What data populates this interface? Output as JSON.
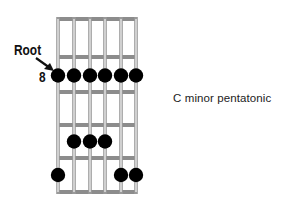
{
  "diagram": {
    "title": "C minor pentatonic",
    "root_label": "Root",
    "start_fret_label": "8",
    "strings": 6,
    "frets_shown": 5,
    "colors": {
      "string": "#9a9a9a",
      "fret": "#8c8c8c",
      "dot": "#000000",
      "text": "#111111"
    },
    "geometry": {
      "string_x": [
        58,
        74,
        90,
        105,
        121,
        136
      ],
      "fret_y": [
        19,
        57,
        92,
        125,
        158,
        192
      ]
    },
    "notes": [
      {
        "string": 1,
        "fret_row": 2,
        "label": "root"
      },
      {
        "string": 2,
        "fret_row": 2
      },
      {
        "string": 3,
        "fret_row": 2
      },
      {
        "string": 4,
        "fret_row": 2
      },
      {
        "string": 5,
        "fret_row": 2
      },
      {
        "string": 6,
        "fret_row": 2
      },
      {
        "string": 2,
        "fret_row": 4
      },
      {
        "string": 3,
        "fret_row": 4
      },
      {
        "string": 4,
        "fret_row": 4
      },
      {
        "string": 1,
        "fret_row": 5
      },
      {
        "string": 5,
        "fret_row": 5
      },
      {
        "string": 6,
        "fret_row": 5
      }
    ]
  }
}
